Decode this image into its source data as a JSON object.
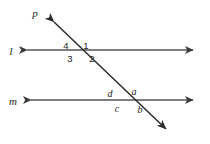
{
  "diagram": {
    "type": "geometry-transversal",
    "background_color": "#ffffff",
    "line_color": "#555555",
    "label_color": "#1a1a1a",
    "lines": [
      {
        "id": "line-l",
        "label": "l",
        "orientation": "horizontal",
        "label_x": 11,
        "label_y": 54,
        "x1": 20,
        "y1": 50,
        "x2": 200,
        "y2": 50,
        "arrows": "both"
      },
      {
        "id": "line-m",
        "label": "m",
        "orientation": "horizontal",
        "label_x": 12,
        "label_y": 104,
        "x1": 24,
        "y1": 100,
        "x2": 200,
        "y2": 100,
        "arrows": "both"
      },
      {
        "id": "line-p",
        "label": "p",
        "orientation": "transversal",
        "label_x": 35,
        "label_y": 15,
        "x1": 47,
        "y1": 16,
        "x2": 172,
        "y2": 135,
        "arrows": "both"
      }
    ],
    "intersections": [
      {
        "id": "intersection-upper",
        "with_line": "l",
        "x": 82,
        "y": 50
      },
      {
        "id": "intersection-lower",
        "with_line": "m",
        "x": 126,
        "y": 100
      }
    ],
    "angle_labels": [
      {
        "id": "angle-4",
        "text": "4",
        "x": 66,
        "y": 49,
        "style": "number",
        "position": "upper-left",
        "at": "intersection-upper"
      },
      {
        "id": "angle-1",
        "text": "1",
        "x": 86,
        "y": 49,
        "style": "number",
        "position": "upper-right",
        "at": "intersection-upper"
      },
      {
        "id": "angle-3",
        "text": "3",
        "x": 70,
        "y": 62,
        "style": "number",
        "position": "lower-left",
        "at": "intersection-upper"
      },
      {
        "id": "angle-2",
        "text": "2",
        "x": 92,
        "y": 62,
        "style": "number",
        "position": "lower-right",
        "at": "intersection-upper"
      },
      {
        "id": "angle-d",
        "text": "d",
        "x": 110,
        "y": 97,
        "style": "letter",
        "position": "upper-left",
        "at": "intersection-lower"
      },
      {
        "id": "angle-a",
        "text": "a",
        "x": 133,
        "y": 95,
        "style": "letter",
        "position": "upper-right",
        "at": "intersection-lower"
      },
      {
        "id": "angle-c",
        "text": "c",
        "x": 117,
        "y": 112,
        "style": "letter",
        "position": "lower-left",
        "at": "intersection-lower"
      },
      {
        "id": "angle-b",
        "text": "b",
        "x": 139,
        "y": 113,
        "style": "letter",
        "position": "lower-right",
        "at": "intersection-lower"
      }
    ]
  }
}
